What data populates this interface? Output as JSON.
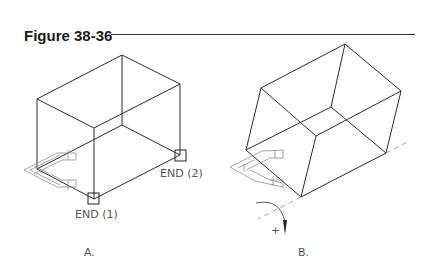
{
  "figure": {
    "title": "Figure 38-36"
  },
  "panels": [
    {
      "id": "A",
      "caption": "A.",
      "snap_labels": [
        "END (1)",
        "END (2)"
      ]
    },
    {
      "id": "B",
      "caption": "B.",
      "rotation_sign": "+"
    }
  ],
  "colors": {
    "line": "#2a2a2a",
    "icon": "#8a8a8a",
    "label": "#555555"
  }
}
